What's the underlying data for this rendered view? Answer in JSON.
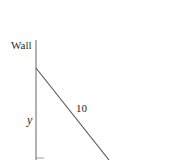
{
  "diagram": {
    "type": "ladder-against-wall",
    "labels": {
      "wall": "Wall",
      "height": "y",
      "ladder_length": "10"
    },
    "colors": {
      "background": "#ffffff",
      "line": "#555555",
      "text": "#2a2a2a"
    }
  }
}
